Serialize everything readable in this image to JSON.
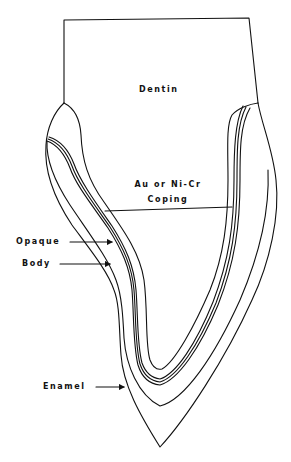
{
  "diagram": {
    "type": "cross-section illustration",
    "line_color": "#111111",
    "background": "#ffffff",
    "labels": {
      "dentin": "Dentin",
      "coping_line1": "Au or Ni-Cr",
      "coping_line2": "Coping",
      "opaque": "Opaque",
      "body": "Body",
      "enamel": "Enamel"
    },
    "layers": [
      "Dentin",
      "Au or Ni-Cr Coping",
      "Opaque",
      "Body",
      "Enamel"
    ]
  }
}
